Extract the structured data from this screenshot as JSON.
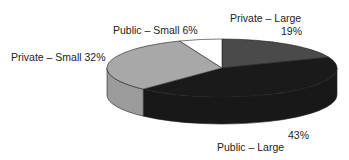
{
  "chart_data": {
    "type": "pie",
    "style": "3d",
    "title": "",
    "categories": [
      "Private – Large",
      "Public – Large",
      "Private – Small",
      "Public – Small"
    ],
    "values": [
      19,
      43,
      32,
      6
    ],
    "unit": "%",
    "colors": {
      "Private – Large": "#4a4a4a",
      "Public – Large": "#1a1a1a",
      "Private – Small": "#a8a8a8",
      "Public – Small": "#ffffff"
    },
    "legend": "none (direct labels)"
  },
  "labels": {
    "private_large_name": "Private – Large",
    "private_large_pct": "19%",
    "public_small": "Public – Small 6%",
    "private_small": "Private – Small 32%",
    "public_large_pct": "43%",
    "public_large_name": "Public – Large"
  }
}
